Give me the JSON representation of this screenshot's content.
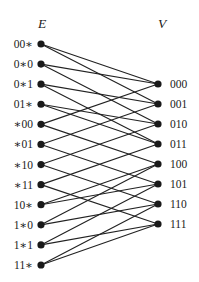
{
  "diagram": {
    "title_left": "E",
    "title_right": "V",
    "left_nodes": [
      "00∗",
      "0∗0",
      "0∗1",
      "01∗",
      "∗00",
      "∗01",
      "∗10",
      "∗11",
      "10∗",
      "1∗0",
      "1∗1",
      "11∗"
    ],
    "right_nodes": [
      "000",
      "001",
      "010",
      "011",
      "100",
      "101",
      "110",
      "111"
    ],
    "edges": [
      [
        "00∗",
        "000"
      ],
      [
        "00∗",
        "001"
      ],
      [
        "0∗0",
        "000"
      ],
      [
        "0∗0",
        "010"
      ],
      [
        "0∗1",
        "001"
      ],
      [
        "0∗1",
        "011"
      ],
      [
        "01∗",
        "010"
      ],
      [
        "01∗",
        "011"
      ],
      [
        "∗00",
        "000"
      ],
      [
        "∗00",
        "100"
      ],
      [
        "∗01",
        "001"
      ],
      [
        "∗01",
        "101"
      ],
      [
        "∗10",
        "010"
      ],
      [
        "∗10",
        "110"
      ],
      [
        "∗11",
        "011"
      ],
      [
        "∗11",
        "111"
      ],
      [
        "10∗",
        "100"
      ],
      [
        "10∗",
        "101"
      ],
      [
        "1∗0",
        "100"
      ],
      [
        "1∗0",
        "110"
      ],
      [
        "1∗1",
        "101"
      ],
      [
        "1∗1",
        "111"
      ],
      [
        "11∗",
        "110"
      ],
      [
        "11∗",
        "111"
      ]
    ],
    "colors": {
      "background": "#ffffff",
      "node": "#1a1a1a",
      "edge": "#222222",
      "text": "#1a1a1a"
    }
  }
}
